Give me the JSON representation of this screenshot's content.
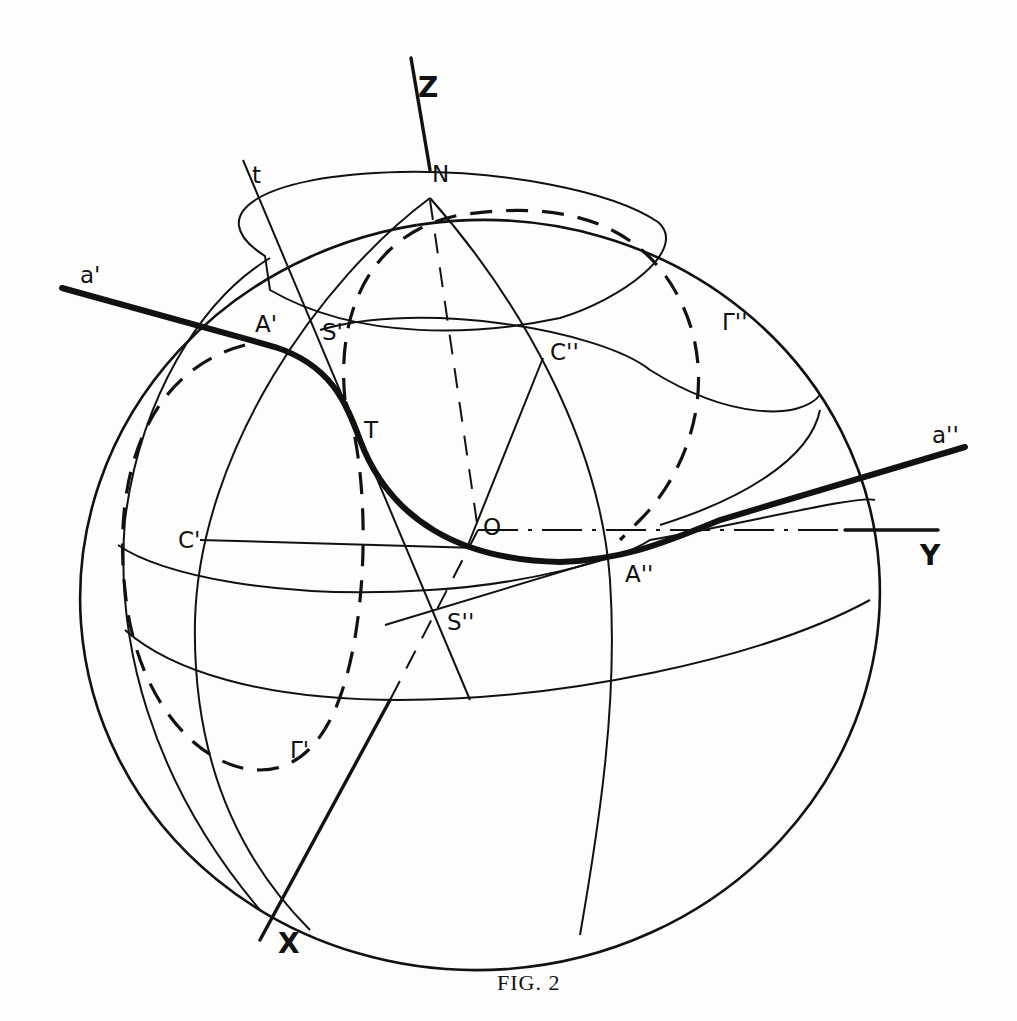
{
  "figure": {
    "caption": "Fig. 2",
    "caption_display": "FIG. 2"
  },
  "axes": {
    "x": "X",
    "y": "Y",
    "z": "Z"
  },
  "points": {
    "north_pole": "N",
    "origin": "O",
    "a_prime_point": "A'",
    "a_double_prime_point": "A''",
    "s_prime": "S'",
    "s_double_prime": "S''",
    "c_prime": "C'",
    "c_double_prime": "C''",
    "tangent_point": "T"
  },
  "lines": {
    "a_prime_line": "a'",
    "a_double_prime_line": "a''",
    "tangent_line": "t"
  },
  "curves": {
    "gamma_prime": "Γ'",
    "gamma_double_prime": "Γ''"
  }
}
